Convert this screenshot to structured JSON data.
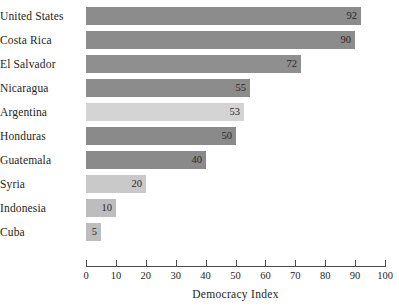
{
  "chart_data": {
    "type": "bar",
    "orientation": "horizontal",
    "title": "",
    "subtitle": "",
    "xlabel": "Democracy Index",
    "ylabel": "",
    "xlim": [
      0,
      100
    ],
    "xticks": [
      0,
      10,
      20,
      30,
      40,
      50,
      60,
      70,
      80,
      90,
      100
    ],
    "xtick_labels": [
      "0",
      "10",
      "20",
      "30",
      "40",
      "50",
      "60",
      "70",
      "80",
      "90",
      "100"
    ],
    "grid": false,
    "legend": false,
    "legend_position": "none",
    "categories": [
      "United States",
      "Costa Rica",
      "El Salvador",
      "Nicaragua",
      "Argentina",
      "Honduras",
      "Guatemala",
      "Syria",
      "Indonesia",
      "Cuba"
    ],
    "values": [
      92,
      90,
      72,
      55,
      53,
      50,
      40,
      20,
      10,
      5
    ],
    "value_labels": [
      "92",
      "90",
      "72",
      "55",
      "53",
      "50",
      "40",
      "20",
      "10",
      "5"
    ],
    "bar_colors": [
      "#8c8c8c",
      "#8c8c8c",
      "#8f8f8f",
      "#8c8c8c",
      "#d4d4d4",
      "#8a8a8a",
      "#8a8a8a",
      "#c9c9c9",
      "#bdbdbd",
      "#bdbdbd"
    ]
  },
  "axis": {
    "line_color": "#4a4a4a",
    "text_color": "#231f20"
  }
}
